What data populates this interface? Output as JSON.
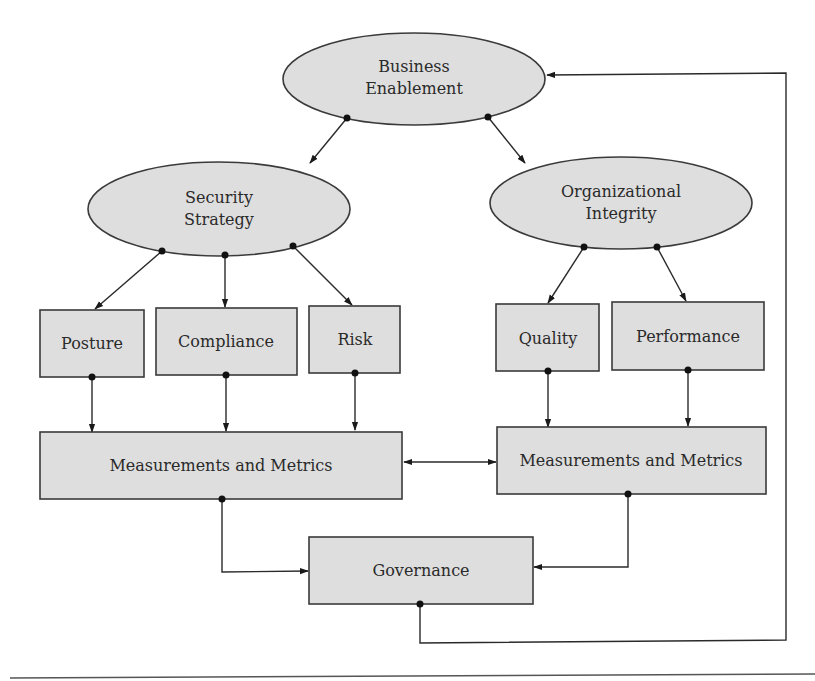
{
  "colors": {
    "node_fill": "#dedede",
    "node_stroke": "#3a3a3a",
    "connector": "#2a2a2a",
    "background": "#ffffff"
  },
  "nodes": {
    "business_enablement": {
      "shape": "ellipse",
      "lines": [
        "Business",
        "Enablement"
      ]
    },
    "security_strategy": {
      "shape": "ellipse",
      "lines": [
        "Security",
        "Strategy"
      ]
    },
    "organizational_integrity": {
      "shape": "ellipse",
      "lines": [
        "Organizational",
        "Integrity"
      ]
    },
    "posture": {
      "shape": "rect",
      "label": "Posture"
    },
    "compliance": {
      "shape": "rect",
      "label": "Compliance"
    },
    "risk": {
      "shape": "rect",
      "label": "Risk"
    },
    "quality": {
      "shape": "rect",
      "label": "Quality"
    },
    "performance": {
      "shape": "rect",
      "label": "Performance"
    },
    "measurements_left": {
      "shape": "rect",
      "label": "Measurements and Metrics"
    },
    "measurements_right": {
      "shape": "rect",
      "label": "Measurements and Metrics"
    },
    "governance": {
      "shape": "rect",
      "label": "Governance"
    }
  },
  "edges": [
    {
      "from": "Business Enablement",
      "to": "Security Strategy"
    },
    {
      "from": "Business Enablement",
      "to": "Organizational Integrity"
    },
    {
      "from": "Security Strategy",
      "to": "Posture"
    },
    {
      "from": "Security Strategy",
      "to": "Compliance"
    },
    {
      "from": "Security Strategy",
      "to": "Risk"
    },
    {
      "from": "Organizational Integrity",
      "to": "Quality"
    },
    {
      "from": "Organizational Integrity",
      "to": "Performance"
    },
    {
      "from": "Posture",
      "to": "Measurements and Metrics (left)"
    },
    {
      "from": "Compliance",
      "to": "Measurements and Metrics (left)"
    },
    {
      "from": "Risk",
      "to": "Measurements and Metrics (left)"
    },
    {
      "from": "Quality",
      "to": "Measurements and Metrics (right)"
    },
    {
      "from": "Performance",
      "to": "Measurements and Metrics (right)"
    },
    {
      "from": "Measurements and Metrics (left)",
      "to": "Measurements and Metrics (right)",
      "bidirectional": true
    },
    {
      "from": "Measurements and Metrics (left)",
      "to": "Governance"
    },
    {
      "from": "Measurements and Metrics (right)",
      "to": "Governance"
    },
    {
      "from": "Governance",
      "to": "Business Enablement",
      "type": "feedback-loop"
    }
  ]
}
